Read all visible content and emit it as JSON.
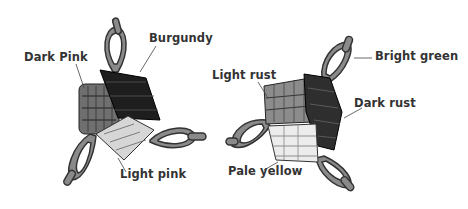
{
  "diagrams": [
    {
      "name": "left-motif",
      "labels": [
        {
          "id": "dark-pink",
          "text": "Dark Pink"
        },
        {
          "id": "burgundy",
          "text": "Burgundy"
        },
        {
          "id": "light-pink",
          "text": "Light pink"
        }
      ]
    },
    {
      "name": "right-motif",
      "labels": [
        {
          "id": "light-rust",
          "text": "Light rust"
        },
        {
          "id": "bright-green",
          "text": "Bright green"
        },
        {
          "id": "dark-rust",
          "text": "Dark rust"
        },
        {
          "id": "pale-yellow",
          "text": "Pale yellow"
        }
      ]
    }
  ],
  "colors": {
    "loop": "#8a8a8a",
    "loop_outline": "#333333",
    "dark_pink": "#6f6f6f",
    "burgundy": "#1e1e1e",
    "light_pink": "#d6d6d6",
    "light_rust": "#8c8c8c",
    "dark_rust": "#2e2e2e",
    "pale_yellow": "#ececec"
  }
}
